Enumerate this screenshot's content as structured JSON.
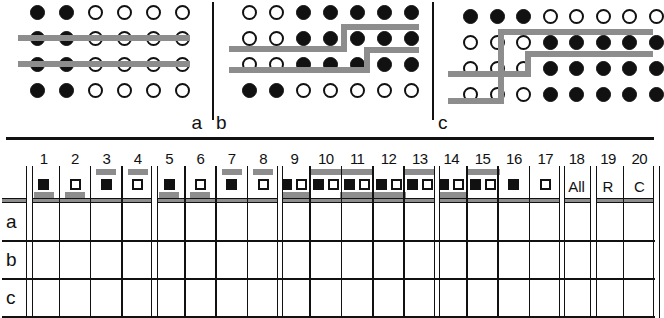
{
  "figure": {
    "panels": [
      {
        "id": "a",
        "label": "a",
        "rows": 4,
        "cols": 6,
        "dots": [
          [
            "filled",
            "filled",
            "open",
            "open",
            "open",
            "open"
          ],
          [
            "filled",
            "filled",
            "open",
            "open",
            "open",
            "open"
          ],
          [
            "filled",
            "filled",
            "open",
            "open",
            "open",
            "open"
          ],
          [
            "filled",
            "filled",
            "open",
            "open",
            "open",
            "open"
          ]
        ],
        "lines": [
          {
            "type": "horizontal",
            "after_row": 1,
            "span": "full"
          },
          {
            "type": "horizontal",
            "after_row": 2,
            "span": "full"
          }
        ]
      },
      {
        "id": "b",
        "label": "b",
        "rows": 4,
        "cols": 7,
        "dots": [
          [
            "open",
            "open",
            "filled",
            "filled",
            "filled",
            "filled",
            "filled"
          ],
          [
            "open",
            "open",
            "filled",
            "filled",
            "filled",
            "filled",
            "filled"
          ],
          [
            "open",
            "open",
            "filled",
            "filled",
            "filled",
            "filled",
            "filled"
          ],
          [
            "filled",
            "filled",
            "open",
            "open",
            "open",
            "open",
            "open"
          ]
        ],
        "lines": [
          {
            "type": "stepped",
            "after_row": 1,
            "step_col": 5
          },
          {
            "type": "stepped",
            "after_row": 2,
            "step_col": 6
          }
        ]
      },
      {
        "id": "c",
        "label": "c",
        "rows": 4,
        "cols": 8,
        "dots": [
          [
            "filled",
            "filled",
            "filled",
            "open",
            "open",
            "open",
            "open",
            "open"
          ],
          [
            "open",
            "open",
            "open",
            "filled",
            "filled",
            "filled",
            "filled",
            "filled"
          ],
          [
            "open",
            "open",
            "open",
            "filled",
            "filled",
            "filled",
            "filled",
            "filled"
          ],
          [
            "open",
            "open",
            "open",
            "filled",
            "filled",
            "filled",
            "filled",
            "filled"
          ]
        ],
        "lines": [
          {
            "type": "stepped-vertical",
            "after_row": 1,
            "step_col": 3
          },
          {
            "type": "stepped-vertical",
            "after_row": 2,
            "step_col": 4
          }
        ]
      }
    ]
  },
  "table": {
    "column_headers": [
      "1",
      "2",
      "3",
      "4",
      "5",
      "6",
      "7",
      "8",
      "9",
      "10",
      "11",
      "12",
      "13",
      "14",
      "15",
      "16",
      "17",
      "18",
      "19",
      "20"
    ],
    "row_labels": [
      "a",
      "b",
      "c"
    ],
    "symbols": [
      {
        "col": "1",
        "squares": [
          "filled"
        ],
        "bar_above": false,
        "bar_below": true,
        "text": null
      },
      {
        "col": "2",
        "squares": [
          "open"
        ],
        "bar_above": false,
        "bar_below": true,
        "text": null
      },
      {
        "col": "3",
        "squares": [
          "filled"
        ],
        "bar_above": true,
        "bar_below": false,
        "text": null
      },
      {
        "col": "4",
        "squares": [
          "open"
        ],
        "bar_above": true,
        "bar_below": false,
        "text": null
      },
      {
        "col": "5",
        "squares": [
          "filled"
        ],
        "bar_above": false,
        "bar_below": true,
        "text": null
      },
      {
        "col": "6",
        "squares": [
          "open"
        ],
        "bar_above": false,
        "bar_below": true,
        "text": null
      },
      {
        "col": "7",
        "squares": [
          "filled"
        ],
        "bar_above": true,
        "bar_below": false,
        "text": null
      },
      {
        "col": "8",
        "squares": [
          "open"
        ],
        "bar_above": true,
        "bar_below": false,
        "text": null
      },
      {
        "col": "9",
        "squares": [
          "filled",
          "open"
        ],
        "bar_above": false,
        "bar_below": true,
        "text": null
      },
      {
        "col": "10",
        "squares": [
          "filled",
          "open"
        ],
        "bar_above": true,
        "bar_below": false,
        "text": null
      },
      {
        "col": "11",
        "squares": [
          "filled",
          "open"
        ],
        "bar_above": true,
        "bar_below": true,
        "text": null
      },
      {
        "col": "12",
        "squares": [
          "filled",
          "open"
        ],
        "bar_above": false,
        "bar_below": true,
        "text": null
      },
      {
        "col": "13",
        "squares": [
          "filled",
          "open"
        ],
        "bar_above": true,
        "bar_below": false,
        "text": null
      },
      {
        "col": "14",
        "squares": [
          "filled",
          "open"
        ],
        "bar_above": false,
        "bar_below": true,
        "text": null
      },
      {
        "col": "15",
        "squares": [
          "filled",
          "open"
        ],
        "bar_above": true,
        "bar_below": false,
        "text": null
      },
      {
        "col": "16",
        "squares": [
          "filled"
        ],
        "bar_above": false,
        "bar_below": false,
        "text": null
      },
      {
        "col": "17",
        "squares": [
          "open"
        ],
        "bar_above": false,
        "bar_below": false,
        "text": null
      },
      {
        "col": "18",
        "squares": [],
        "bar_above": false,
        "bar_below": false,
        "text": "All"
      },
      {
        "col": "19",
        "squares": [],
        "bar_above": false,
        "bar_below": false,
        "text": "R"
      },
      {
        "col": "20",
        "squares": [],
        "bar_above": false,
        "bar_below": false,
        "text": "C"
      }
    ],
    "cells": [
      {
        "row": "a",
        "values": [
          "",
          "",
          "",
          "",
          "",
          "",
          "",
          "",
          "",
          "",
          "",
          "",
          "",
          "",
          "",
          "",
          "",
          "",
          "",
          ""
        ]
      },
      {
        "row": "b",
        "values": [
          "",
          "",
          "",
          "",
          "",
          "",
          "",
          "",
          "",
          "",
          "",
          "",
          "",
          "",
          "",
          "",
          "",
          "",
          "",
          ""
        ]
      },
      {
        "row": "c",
        "values": [
          "",
          "",
          "",
          "",
          "",
          "",
          "",
          "",
          "",
          "",
          "",
          "",
          "",
          "",
          "",
          "",
          "",
          "",
          "",
          ""
        ]
      }
    ],
    "group_separators_before_columns": [
      "5",
      "9",
      "14",
      "18",
      "19"
    ]
  },
  "colors": {
    "ink": "#111111",
    "line_gray": "#8d8d8d",
    "background": "#ffffff"
  }
}
